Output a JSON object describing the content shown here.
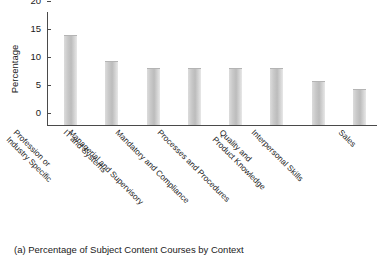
{
  "chart_data": {
    "type": "bar",
    "title": "",
    "xlabel": "",
    "ylabel": "Percentage",
    "ylim": [
      0,
      20
    ],
    "yticks": [
      0,
      5,
      10,
      15,
      20
    ],
    "grid": false,
    "legend": null,
    "categories": [
      "Profession or Industry Specific",
      "IT and Systems",
      "Managerial and Supervisory",
      "Mandatory and Compliance",
      "Processes and Procedures",
      "Quality and Product Knowledge",
      "Interpersonal Skills",
      "Sales"
    ],
    "category_lines": [
      [
        "Profession or",
        "Industry Specific"
      ],
      [
        "IT and Systems"
      ],
      [
        "Managerial and Supervisory"
      ],
      [
        "Mandatory and Compliance"
      ],
      [
        "Processes and Procedures"
      ],
      [
        "Quality and",
        "Product Knowledge"
      ],
      [
        "Interpersonal Skills"
      ],
      [
        "Sales"
      ]
    ],
    "values": [
      16.0,
      11.5,
      10.2,
      10.2,
      10.2,
      10.2,
      7.9,
      6.4
    ],
    "bar_color": "#c9c9c9"
  },
  "caption": {
    "text": "(a) Percentage of Subject Content Courses by Context"
  },
  "axis": {
    "y_tick_labels": [
      "20",
      "15",
      "10",
      "5",
      "0"
    ]
  }
}
